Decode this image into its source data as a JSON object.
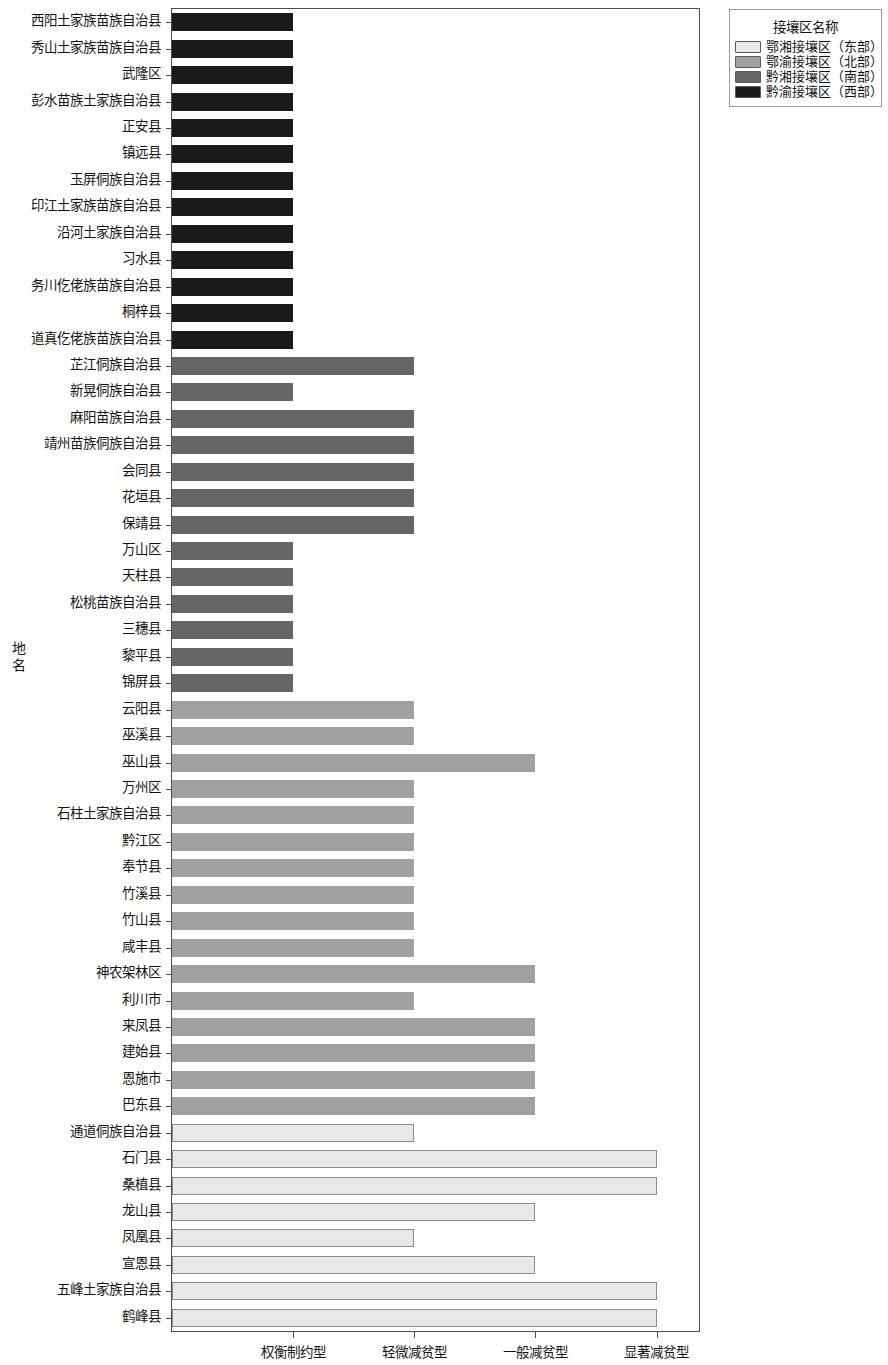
{
  "legend": {
    "title": "接壤区名称",
    "items": [
      {
        "label": "鄂湘接壤区（东部）",
        "color": "#e8e8e8"
      },
      {
        "label": "鄂渝接壤区（北部）",
        "color": "#a0a0a0"
      },
      {
        "label": "黔湘接壤区（南部）",
        "color": "#666666"
      },
      {
        "label": "黔渝接壤区（西部）",
        "color": "#1a1a1a"
      }
    ]
  },
  "axes": {
    "y_title": "地名",
    "x_tick_labels": [
      "权衡制约型",
      "轻微减贫型",
      "一般减贫型",
      "显著减贫型"
    ]
  },
  "chart_data": {
    "type": "bar",
    "orientation": "horizontal",
    "title": "",
    "xlabel": "",
    "ylabel": "地名",
    "grid": false,
    "legend_position": "top-right",
    "legend_title": "接壤区名称",
    "x_tick_labels": [
      "权衡制约型",
      "轻微减贫型",
      "一般减贫型",
      "显著减贫型"
    ],
    "x_tick_values": [
      1,
      2,
      3,
      4
    ],
    "xlim": [
      0,
      4.35
    ],
    "series": [
      {
        "name": "鄂湘接壤区（东部）",
        "color": "#e8e8e8"
      },
      {
        "name": "鄂渝接壤区（北部）",
        "color": "#a0a0a0"
      },
      {
        "name": "黔湘接壤区（南部）",
        "color": "#666666"
      },
      {
        "name": "黔渝接壤区（西部）",
        "color": "#1a1a1a"
      }
    ],
    "categories": [
      "西阳土家族苗族自治县",
      "秀山土家族苗族自治县",
      "武隆区",
      "彭水苗族土家族自治县",
      "正安县",
      "镇远县",
      "玉屏侗族自治县",
      "印江土家族苗族自治县",
      "沿河土家族自治县",
      "习水县",
      "务川仡佬族苗族自治县",
      "桐梓县",
      "道真仡佬族苗族自治县",
      "芷江侗族自治县",
      "新晃侗族自治县",
      "麻阳苗族自治县",
      "靖州苗族侗族自治县",
      "会同县",
      "花垣县",
      "保靖县",
      "万山区",
      "天柱县",
      "松桃苗族自治县",
      "三穗县",
      "黎平县",
      "锦屏县",
      "云阳县",
      "巫溪县",
      "巫山县",
      "万州区",
      "石柱土家族自治县",
      "黔江区",
      "奉节县",
      "竹溪县",
      "竹山县",
      "咸丰县",
      "神农架林区",
      "利川市",
      "来凤县",
      "建始县",
      "恩施市",
      "巴东县",
      "通道侗族自治县",
      "石门县",
      "桑植县",
      "龙山县",
      "凤凰县",
      "宣恩县",
      "五峰土家族自治县",
      "鹤峰县"
    ],
    "values": [
      1.0,
      1.0,
      1.0,
      1.0,
      1.0,
      1.0,
      1.0,
      1.0,
      1.0,
      1.0,
      1.0,
      1.0,
      1.0,
      2.0,
      1.0,
      2.0,
      2.0,
      2.0,
      2.0,
      2.0,
      1.0,
      1.0,
      1.0,
      1.0,
      1.0,
      1.0,
      2.0,
      2.0,
      3.0,
      2.0,
      2.0,
      2.0,
      2.0,
      2.0,
      2.0,
      2.0,
      3.0,
      2.0,
      3.0,
      3.0,
      3.0,
      3.0,
      2.0,
      4.0,
      4.0,
      3.0,
      2.0,
      3.0,
      4.0,
      4.0
    ],
    "group_of_category": [
      "黔渝接壤区（西部）",
      "黔渝接壤区（西部）",
      "黔渝接壤区（西部）",
      "黔渝接壤区（西部）",
      "黔渝接壤区（西部）",
      "黔渝接壤区（西部）",
      "黔渝接壤区（西部）",
      "黔渝接壤区（西部）",
      "黔渝接壤区（西部）",
      "黔渝接壤区（西部）",
      "黔渝接壤区（西部）",
      "黔渝接壤区（西部）",
      "黔渝接壤区（西部）",
      "黔湘接壤区（南部）",
      "黔湘接壤区（南部）",
      "黔湘接壤区（南部）",
      "黔湘接壤区（南部）",
      "黔湘接壤区（南部）",
      "黔湘接壤区（南部）",
      "黔湘接壤区（南部）",
      "黔湘接壤区（南部）",
      "黔湘接壤区（南部）",
      "黔湘接壤区（南部）",
      "黔湘接壤区（南部）",
      "黔湘接壤区（南部）",
      "黔湘接壤区（南部）",
      "鄂渝接壤区（北部）",
      "鄂渝接壤区（北部）",
      "鄂渝接壤区（北部）",
      "鄂渝接壤区（北部）",
      "鄂渝接壤区（北部）",
      "鄂渝接壤区（北部）",
      "鄂渝接壤区（北部）",
      "鄂渝接壤区（北部）",
      "鄂渝接壤区（北部）",
      "鄂渝接壤区（北部）",
      "鄂渝接壤区（北部）",
      "鄂渝接壤区（北部）",
      "鄂渝接壤区（北部）",
      "鄂渝接壤区（北部）",
      "鄂渝接壤区（北部）",
      "鄂渝接壤区（北部）",
      "鄂湘接壤区（东部）",
      "鄂湘接壤区（东部）",
      "鄂湘接壤区（东部）",
      "鄂湘接壤区（东部）",
      "鄂湘接壤区（东部）",
      "鄂湘接壤区（东部）",
      "鄂湘接壤区（东部）",
      "鄂湘接壤区（东部）"
    ]
  }
}
